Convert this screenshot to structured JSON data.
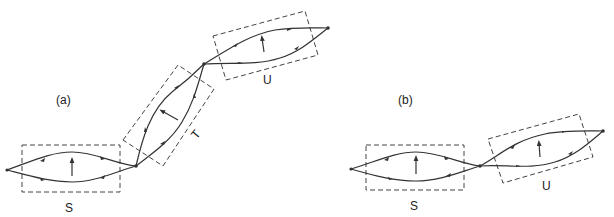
{
  "panels": {
    "a": {
      "label": "(a)",
      "boxes": {
        "S": "S",
        "T": "T",
        "U": "U"
      }
    },
    "b": {
      "label": "(b)",
      "boxes": {
        "S": "S",
        "U": "U"
      }
    }
  },
  "colors": {
    "stroke": "#333333",
    "dash": "#444444",
    "background": "#ffffff"
  }
}
